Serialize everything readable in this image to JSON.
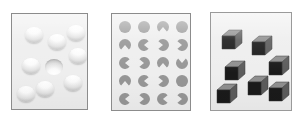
{
  "figure": {
    "background_color": "#ffffff",
    "panel_background": "#eeeeee",
    "panel_border": "#8c8c8c"
  },
  "panels": [
    {
      "id": "panel-a",
      "name": "shaded-spheres-panel",
      "label": "a",
      "description": "Shaded circles lit from above; one odd item is shaded from below",
      "item_type": "shaded-sphere",
      "item_count": 9,
      "target_count": 1,
      "colors": {
        "highlight": "#ffffff",
        "shadow": "#a6a6a6"
      },
      "items": [
        {
          "x": 13,
          "y": 13,
          "shading": "convex",
          "role": "distractor"
        },
        {
          "x": 36,
          "y": 20,
          "shading": "convex",
          "role": "distractor"
        },
        {
          "x": 55,
          "y": 11,
          "shading": "convex",
          "role": "distractor"
        },
        {
          "x": 57,
          "y": 34,
          "shading": "convex",
          "role": "distractor"
        },
        {
          "x": 10,
          "y": 44,
          "shading": "convex",
          "role": "distractor"
        },
        {
          "x": 33,
          "y": 45,
          "shading": "concave",
          "role": "target"
        },
        {
          "x": 52,
          "y": 61,
          "shading": "convex",
          "role": "distractor"
        },
        {
          "x": 24,
          "y": 67,
          "shading": "convex",
          "role": "distractor"
        },
        {
          "x": 5,
          "y": 72,
          "shading": "convex",
          "role": "distractor"
        }
      ]
    },
    {
      "id": "panel-b",
      "name": "pacman-discs-panel",
      "label": "b",
      "description": "Grid of discs; some full circles, most with a wedge notch at varying orientations",
      "item_type": "pacman-disc",
      "item_count": 20,
      "rows": 5,
      "columns": 4,
      "colors": {
        "disc": "#969696"
      },
      "items": [
        {
          "x": 7,
          "y": 7,
          "notch": "none",
          "angle": 0
        },
        {
          "x": 26,
          "y": 7,
          "notch": "none",
          "angle": 0
        },
        {
          "x": 45,
          "y": 7,
          "notch": "bottom",
          "angle": 90
        },
        {
          "x": 64,
          "y": 7,
          "notch": "none",
          "angle": 0
        },
        {
          "x": 7,
          "y": 25,
          "notch": "bottom",
          "angle": 90
        },
        {
          "x": 26,
          "y": 25,
          "notch": "right",
          "angle": 0
        },
        {
          "x": 45,
          "y": 25,
          "notch": "left",
          "angle": 180
        },
        {
          "x": 64,
          "y": 25,
          "notch": "left",
          "angle": 180
        },
        {
          "x": 7,
          "y": 43,
          "notch": "right",
          "angle": 0
        },
        {
          "x": 26,
          "y": 43,
          "notch": "left",
          "angle": 180
        },
        {
          "x": 45,
          "y": 43,
          "notch": "bottom",
          "angle": 90
        },
        {
          "x": 64,
          "y": 43,
          "notch": "top",
          "angle": 270
        },
        {
          "x": 7,
          "y": 61,
          "notch": "bottom",
          "angle": 90
        },
        {
          "x": 26,
          "y": 61,
          "notch": "right",
          "angle": 0
        },
        {
          "x": 45,
          "y": 61,
          "notch": "left",
          "angle": 180
        },
        {
          "x": 64,
          "y": 61,
          "notch": "none",
          "angle": 0
        },
        {
          "x": 7,
          "y": 79,
          "notch": "right",
          "angle": 0
        },
        {
          "x": 26,
          "y": 79,
          "notch": "left",
          "angle": 180
        },
        {
          "x": 45,
          "y": 79,
          "notch": "right",
          "angle": 0
        },
        {
          "x": 64,
          "y": 79,
          "notch": "left",
          "angle": 180
        }
      ]
    },
    {
      "id": "panel-c",
      "name": "cubes-panel",
      "label": "c",
      "description": "Scattered 3D cubes drawn with a black front face and grey top/side faces",
      "item_type": "cube",
      "item_count": 7,
      "colors": {
        "front_face": "#1a1a1a",
        "top_face": "#8f8f8f",
        "side_face": "#5c5c5c",
        "edge": "#3a3a3a"
      },
      "items": [
        {
          "x": 10,
          "y": 16,
          "orientation": "top-left-light"
        },
        {
          "x": 40,
          "y": 22,
          "orientation": "top-left-light"
        },
        {
          "x": 57,
          "y": 42,
          "orientation": "top-left-light"
        },
        {
          "x": 13,
          "y": 47,
          "orientation": "top-left-light"
        },
        {
          "x": 36,
          "y": 62,
          "orientation": "top-left-light"
        },
        {
          "x": 5,
          "y": 70,
          "orientation": "top-left-light"
        },
        {
          "x": 57,
          "y": 68,
          "orientation": "top-left-light"
        }
      ]
    }
  ]
}
